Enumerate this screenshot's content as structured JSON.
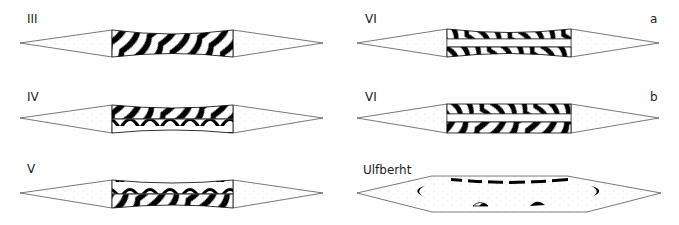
{
  "figure": {
    "panels": [
      {
        "id": "III",
        "label": "III",
        "sublabel": "",
        "type": "single-core"
      },
      {
        "id": "IV",
        "label": "IV",
        "sublabel": "",
        "type": "two-layer-core"
      },
      {
        "id": "V",
        "label": "V",
        "sublabel": "",
        "type": "two-layer-core"
      },
      {
        "id": "VIa",
        "label": "VI",
        "sublabel": "a",
        "type": "split-core-with-center-strip"
      },
      {
        "id": "VIb",
        "label": "VI",
        "sublabel": "b",
        "type": "split-core-with-center-strip"
      },
      {
        "id": "Ulfberht",
        "label": "Ulfberht",
        "sublabel": "",
        "type": "hexagonal-homogeneous-with-inclusions"
      }
    ],
    "colors": {
      "outline": "#555555",
      "pattern": "#000000",
      "edge_fill": "#ffffff",
      "speckle": "#bbbbbb"
    }
  }
}
